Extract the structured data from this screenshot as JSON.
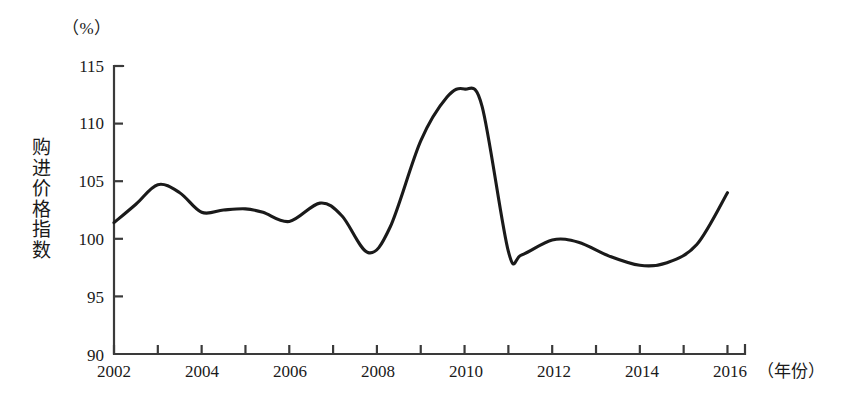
{
  "chart_data": {
    "type": "line",
    "title": "",
    "unit_label": "（%）",
    "ylabel": "购进价格指数",
    "xlabel": "（年份）",
    "xlim": [
      2002,
      2016.4
    ],
    "ylim": [
      90,
      115
    ],
    "grid": false,
    "legend": "none",
    "line_color": "#1a1a1a",
    "axis_color": "#3a3a3a",
    "y_ticks": [
      90,
      95,
      100,
      105,
      110,
      115
    ],
    "y_tick_labels": [
      "90",
      "95",
      "100",
      "105",
      "110",
      "115"
    ],
    "x_ticks": [
      2002,
      2003,
      2004,
      2005,
      2006,
      2007,
      2008,
      2009,
      2010,
      2011,
      2012,
      2013,
      2014,
      2015,
      2016
    ],
    "x_tick_labels_shown": [
      "2002",
      "2004",
      "2006",
      "2008",
      "2010",
      "2012",
      "2014",
      "2016"
    ],
    "x_labeled_ticks": [
      2002,
      2004,
      2006,
      2008,
      2010,
      2012,
      2014,
      2016
    ],
    "x": [
      2002.0,
      2002.5,
      2003.0,
      2003.5,
      2004.0,
      2004.5,
      2005.0,
      2005.4,
      2006.0,
      2006.7,
      2007.2,
      2007.8,
      2008.3,
      2009.0,
      2009.6,
      2010.0,
      2010.4,
      2011.0,
      2011.3,
      2012.0,
      2012.6,
      2013.3,
      2014.0,
      2014.6,
      2015.3,
      2016.0
    ],
    "y": [
      101.4,
      103.0,
      104.7,
      104.0,
      102.3,
      102.5,
      102.6,
      102.3,
      101.5,
      103.1,
      102.0,
      98.8,
      101.0,
      108.5,
      112.3,
      113.0,
      111.5,
      98.9,
      98.6,
      99.9,
      99.7,
      98.5,
      97.7,
      97.9,
      99.5,
      104.0
    ],
    "annotations": []
  }
}
